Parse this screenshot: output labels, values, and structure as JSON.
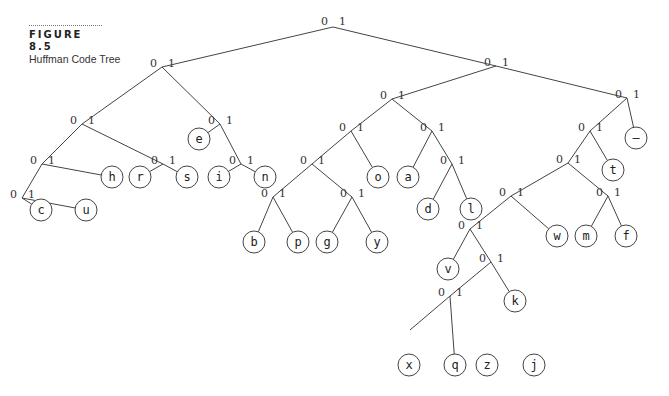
{
  "figure": {
    "number": "FIGURE 8.5",
    "title": "Huffman Code Tree"
  },
  "tree": {
    "edge_labels": {
      "left": "0",
      "right": "1"
    },
    "leaves": [
      {
        "symbol": "c",
        "code": "00000"
      },
      {
        "symbol": "u",
        "code": "00001"
      },
      {
        "symbol": "h",
        "code": "0001"
      },
      {
        "symbol": "r",
        "code": "0010"
      },
      {
        "symbol": "s",
        "code": "0011"
      },
      {
        "symbol": "e",
        "code": "010"
      },
      {
        "symbol": "i",
        "code": "0110"
      },
      {
        "symbol": "n",
        "code": "0111"
      },
      {
        "symbol": "b",
        "code": "100000"
      },
      {
        "symbol": "p",
        "code": "100001"
      },
      {
        "symbol": "g",
        "code": "100010"
      },
      {
        "symbol": "y",
        "code": "100011"
      },
      {
        "symbol": "o",
        "code": "1001"
      },
      {
        "symbol": "a",
        "code": "1010"
      },
      {
        "symbol": "d",
        "code": "10110"
      },
      {
        "symbol": "l",
        "code": "10111"
      },
      {
        "symbol": "v",
        "code": "1100000"
      },
      {
        "symbol": "x",
        "code": "110000100"
      },
      {
        "symbol": "q",
        "code": "110000101"
      },
      {
        "symbol": "z",
        "code": "110000110"
      },
      {
        "symbol": "j",
        "code": "110000111"
      },
      {
        "symbol": "k",
        "code": "11000011"
      },
      {
        "symbol": "w",
        "code": "110001"
      },
      {
        "symbol": "m",
        "code": "110010"
      },
      {
        "symbol": "f",
        "code": "110011"
      },
      {
        "symbol": "t",
        "code": "1101"
      },
      {
        "symbol": "—",
        "code": "111"
      }
    ]
  }
}
